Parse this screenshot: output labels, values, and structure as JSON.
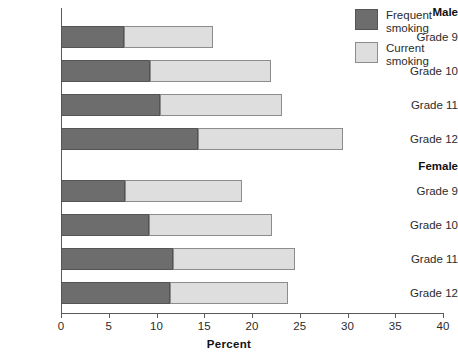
{
  "chart_data": {
    "type": "bar",
    "subtype": "stacked-horizontal",
    "title": "",
    "xlabel": "Percent",
    "ylabel": "",
    "xlim": [
      0,
      40
    ],
    "xticks": [
      0,
      5,
      10,
      15,
      20,
      25,
      30,
      35,
      40
    ],
    "xtick_labels": [
      "0",
      "5",
      "10",
      "15",
      "20",
      "25",
      "30",
      "35",
      "40"
    ],
    "grid": false,
    "legend_position": "top-right",
    "series": [
      {
        "name": "Frequent smoking",
        "color": "#6d6d6d",
        "values": [
          6.6,
          9.3,
          10.4,
          14.3,
          6.7,
          9.2,
          11.7,
          11.4
        ]
      },
      {
        "name": "Current smoking",
        "color": "#dedede",
        "values": [
          9.3,
          12.7,
          12.7,
          15.2,
          12.3,
          12.9,
          12.8,
          12.4
        ]
      }
    ],
    "groups": [
      {
        "label": "Male",
        "categories": [
          "Grade 9",
          "Grade 10",
          "Grade 11",
          "Grade 12"
        ],
        "totals": [
          15.9,
          22.0,
          23.1,
          29.5
        ]
      },
      {
        "label": "Female",
        "categories": [
          "Grade 9",
          "Grade 10",
          "Grade 11",
          "Grade 12"
        ],
        "totals": [
          19.0,
          22.1,
          24.5,
          23.8
        ]
      }
    ],
    "rows": [
      {
        "group": "Male",
        "category": "Grade 9",
        "frequent": 6.6,
        "total": 15.9
      },
      {
        "group": "Male",
        "category": "Grade 10",
        "frequent": 9.3,
        "total": 22.0
      },
      {
        "group": "Male",
        "category": "Grade 11",
        "frequent": 10.4,
        "total": 23.1
      },
      {
        "group": "Male",
        "category": "Grade 12",
        "frequent": 14.3,
        "total": 29.5
      },
      {
        "group": "Female",
        "category": "Grade 9",
        "frequent": 6.7,
        "total": 19.0
      },
      {
        "group": "Female",
        "category": "Grade 10",
        "frequent": 9.2,
        "total": 22.1
      },
      {
        "group": "Female",
        "category": "Grade 11",
        "frequent": 11.7,
        "total": 24.5
      },
      {
        "group": "Female",
        "category": "Grade 12",
        "frequent": 11.4,
        "total": 23.8
      }
    ]
  },
  "legend": {
    "entries": [
      {
        "label": "Frequent\nsmoking",
        "swatch": "frequent-swatch"
      },
      {
        "label": "Current\nsmoking",
        "swatch": "current-swatch"
      }
    ]
  },
  "axis": {
    "x_title": "Percent"
  }
}
